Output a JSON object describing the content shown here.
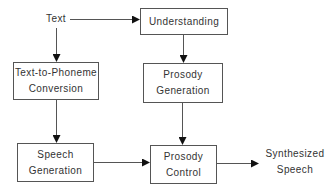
{
  "diagram": {
    "type": "flowchart",
    "nodes": {
      "text": {
        "lines": [
          "Text"
        ]
      },
      "understanding": {
        "lines": [
          "Understanding"
        ]
      },
      "text_to_phoneme": {
        "lines": [
          "Text-to-Phoneme",
          "Conversion"
        ]
      },
      "prosody_generation": {
        "lines": [
          "Prosody",
          "Generation"
        ]
      },
      "speech_generation": {
        "lines": [
          "Speech",
          "Generation"
        ]
      },
      "prosody_control": {
        "lines": [
          "Prosody",
          "Control"
        ]
      },
      "synthesized_speech": {
        "lines": [
          "Synthesized",
          "Speech"
        ]
      }
    },
    "edges": [
      {
        "from": "Text",
        "to": "Understanding"
      },
      {
        "from": "Text",
        "to": "Text-to-Phoneme Conversion"
      },
      {
        "from": "Understanding",
        "to": "Prosody Generation"
      },
      {
        "from": "Text-to-Phoneme Conversion",
        "to": "Speech Generation"
      },
      {
        "from": "Prosody Generation",
        "to": "Prosody Control"
      },
      {
        "from": "Speech Generation",
        "to": "Prosody Control"
      },
      {
        "from": "Prosody Control",
        "to": "Synthesized Speech"
      }
    ],
    "colors": {
      "stroke": "#555555",
      "text": "#333333",
      "background": "#ffffff"
    }
  }
}
